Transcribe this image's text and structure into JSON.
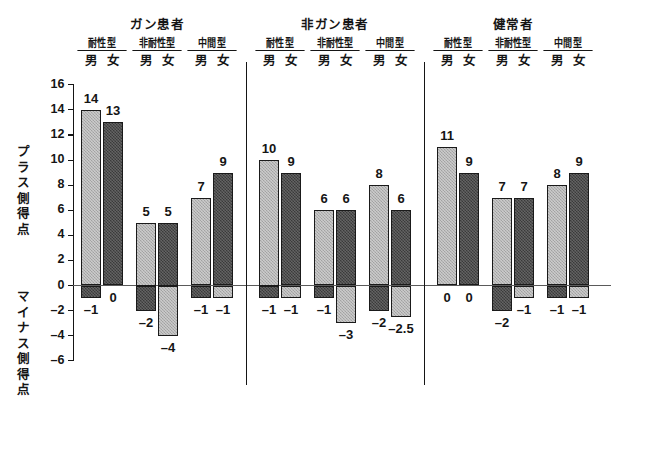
{
  "chart_data": {
    "type": "bar",
    "title": "",
    "xlabel": "",
    "ylabel_positive": "プラス側得点",
    "ylabel_negative": "マイナス側得点",
    "ylim": [
      -6,
      16
    ],
    "ytick_step": 2,
    "yticks": [
      "16",
      "14",
      "12",
      "10",
      "8",
      "6",
      "4",
      "2",
      "0",
      "-2",
      "-4",
      "-6"
    ],
    "grid": false,
    "legend": "none",
    "zero_line": 0,
    "groups": [
      "ガン患者",
      "非ガン患者",
      "健常者"
    ],
    "subtypes": [
      "耐性型",
      "非耐性型",
      "中間型"
    ],
    "sexes": [
      "男",
      "女"
    ],
    "categories": [
      "ガン患者・耐性型・男",
      "ガン患者・耐性型・女",
      "ガン患者・非耐性型・男",
      "ガン患者・非耐性型・女",
      "ガン患者・中間型・男",
      "ガン患者・中間型・女",
      "非ガン患者・耐性型・男",
      "非ガン患者・耐性型・女",
      "非ガン患者・非耐性型・男",
      "非ガン患者・非耐性型・女",
      "非ガン患者・中間型・男",
      "非ガン患者・中間型・女",
      "健常者・耐性型・男",
      "健常者・耐性型・女",
      "健常者・非耐性型・男",
      "健常者・非耐性型・女",
      "健常者・中間型・男",
      "健常者・中間型・女"
    ],
    "series": [
      {
        "name": "プラス側得点",
        "values": [
          14,
          13,
          5,
          5,
          7,
          9,
          10,
          9,
          6,
          6,
          8,
          6,
          11,
          9,
          7,
          7,
          8,
          9
        ],
        "labels": [
          "14",
          "13",
          "5",
          "5",
          "7",
          "9",
          "10",
          "9",
          "6",
          "6",
          "8",
          "6",
          "11",
          "9",
          "7",
          "7",
          "8",
          "9"
        ]
      },
      {
        "name": "マイナス側得点",
        "values": [
          -1,
          0,
          -2,
          -4,
          -1,
          -1,
          -1,
          -1,
          -1,
          -3,
          -2,
          -2.5,
          0,
          0,
          -2,
          -1,
          -1,
          -1
        ],
        "labels": [
          "-1",
          "0",
          "-2",
          "-4",
          "-1",
          "-1",
          "-1",
          "-1",
          "-1",
          "-3",
          "-2",
          "-2.5",
          "0",
          "0",
          "-2",
          "-1",
          "-1",
          "-1"
        ]
      }
    ],
    "bar_colors": {
      "male": "#b0b0b0",
      "female": "#4a4a4a"
    },
    "axis_color": "#151515"
  }
}
